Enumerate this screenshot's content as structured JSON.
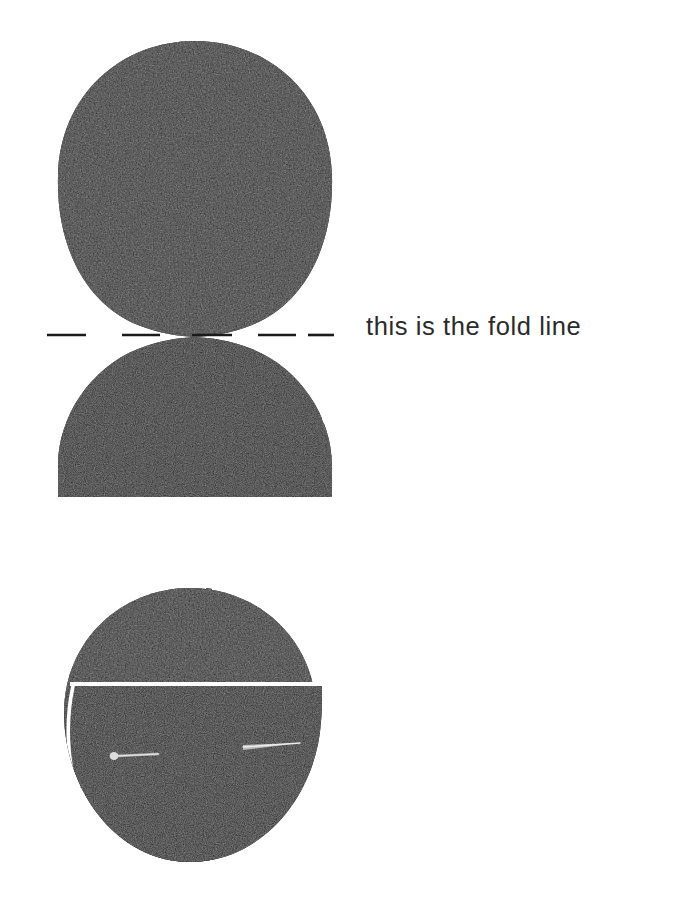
{
  "page": {
    "width": 681,
    "height": 909,
    "background_color": "#ffffff",
    "kind": "craft-instruction-diagram"
  },
  "annotations": {
    "fold_line_label": "this is the fold line",
    "fold_line_label_color": "#2b2b2b"
  },
  "colors": {
    "felt_dark": "#171717",
    "felt_dark_alt": "#1f1f1f",
    "felt_shadow": "#0b0b0b",
    "paper_white": "#ffffff",
    "dash_color": "#1a1a1a",
    "pin_silver": "#c9c9c9",
    "pin_silver_dim": "#8e8e8e"
  },
  "figures": [
    {
      "id": "figure-unfolded",
      "name": "unfolded-felt-piece",
      "caption_ref": "this is the fold line",
      "parts": [
        {
          "name": "upper-lobe",
          "shape": "rounded-oval",
          "cx": 195,
          "cy": 190,
          "rx": 138,
          "ry": 150
        },
        {
          "name": "lower-lobe",
          "shape": "dome-flat-bottom",
          "cx": 195,
          "cy": 497,
          "rx": 137,
          "ry": 153
        }
      ],
      "pinch_point": {
        "x": 195,
        "y": 337
      }
    },
    {
      "id": "figure-folded",
      "name": "folded-pinned-felt-piece",
      "parts": [
        {
          "name": "folded-body",
          "shape": "rounded-blob",
          "cx": 190,
          "cy": 725,
          "rx": 126,
          "ry": 137
        },
        {
          "name": "fold-edge-line",
          "shape": "horizontal-white-line",
          "y": 684
        },
        {
          "name": "seam-curve",
          "shape": "white-crescent-curve",
          "side": "left-bottom"
        }
      ],
      "pins": [
        {
          "name": "pin-left",
          "head": "left",
          "x1": 112,
          "y1": 757,
          "x2": 158,
          "y2": 755
        },
        {
          "name": "pin-right",
          "head": "left",
          "x1": 243,
          "y1": 747,
          "x2": 300,
          "y2": 743
        }
      ]
    }
  ],
  "fold_line": {
    "name": "dashed-fold-line",
    "y": 335,
    "from_x": 47,
    "to_x": 334,
    "dashes": [
      {
        "x1": 47,
        "x2": 86
      },
      {
        "x1": 122,
        "x2": 160
      },
      {
        "x1": 192,
        "x2": 232
      },
      {
        "x1": 258,
        "x2": 296
      },
      {
        "x1": 308,
        "x2": 334
      }
    ],
    "stroke_width": 2.4
  }
}
